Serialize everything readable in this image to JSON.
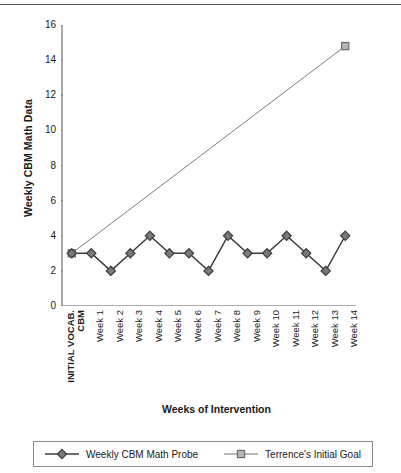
{
  "chart_data": {
    "type": "line",
    "title": "",
    "xlabel": "Weeks of Intervention",
    "ylabel": "Weekly CBM Math Data",
    "ylim": [
      0,
      16
    ],
    "yticks": [
      0,
      2,
      4,
      6,
      8,
      10,
      12,
      14,
      16
    ],
    "grid": false,
    "legend_position": "bottom",
    "categories": [
      "INITIAL VOCAB. CBM",
      "Week 1",
      "Week 2",
      "Week 3",
      "Week 4",
      "Week 5",
      "Week 6",
      "Week 7",
      "Week 8",
      "Week 9",
      "Week 10",
      "Week 11",
      "Week 12",
      "Week 13",
      "Week 14"
    ],
    "series": [
      {
        "name": "Weekly CBM Math Probe",
        "marker": "diamond",
        "color": "#7a7a7a",
        "line_color": "#3c3c3c",
        "values": [
          3,
          3,
          2,
          3,
          4,
          3,
          3,
          2,
          4,
          3,
          3,
          4,
          3,
          2,
          4
        ]
      },
      {
        "name": "Terrence's Initial Goal",
        "marker": "square",
        "color": "#b5b5b5",
        "line_color": "#6e6e6e",
        "values": [
          3,
          null,
          null,
          null,
          null,
          null,
          null,
          null,
          null,
          null,
          null,
          null,
          null,
          null,
          14.8
        ]
      }
    ]
  },
  "axes": {
    "y_title": "Weekly CBM Math Data",
    "x_title": "Weeks of Intervention",
    "y_tick_labels": [
      "16",
      "14",
      "12",
      "10",
      "8",
      "6",
      "4",
      "2",
      "0"
    ],
    "x_tick_labels": [
      {
        "line1": "INITIAL VOCAB.",
        "line2": "CBM",
        "bold": true
      },
      {
        "line1": "Week 1"
      },
      {
        "line1": "Week 2"
      },
      {
        "line1": "Week 3"
      },
      {
        "line1": "Week 4"
      },
      {
        "line1": "Week 5"
      },
      {
        "line1": "Week 6"
      },
      {
        "line1": "Week 7"
      },
      {
        "line1": "Week 8"
      },
      {
        "line1": "Week 9"
      },
      {
        "line1": "Week 10"
      },
      {
        "line1": "Week 11"
      },
      {
        "line1": "Week 12"
      },
      {
        "line1": "Week 13"
      },
      {
        "line1": "Week 14"
      }
    ]
  },
  "legend": {
    "items": [
      {
        "label": "Weekly CBM Math Probe",
        "marker": "diamond"
      },
      {
        "label": "Terrence's Initial Goal",
        "marker": "square"
      }
    ]
  },
  "colors": {
    "axis": "#555555",
    "probe_line": "#3c3c3c",
    "probe_fill": "#7a7a7a",
    "goal_line": "#6e6e6e",
    "goal_fill": "#b5b5b5",
    "text": "#1a1a1a",
    "legend_border": "#8a8a8a"
  }
}
